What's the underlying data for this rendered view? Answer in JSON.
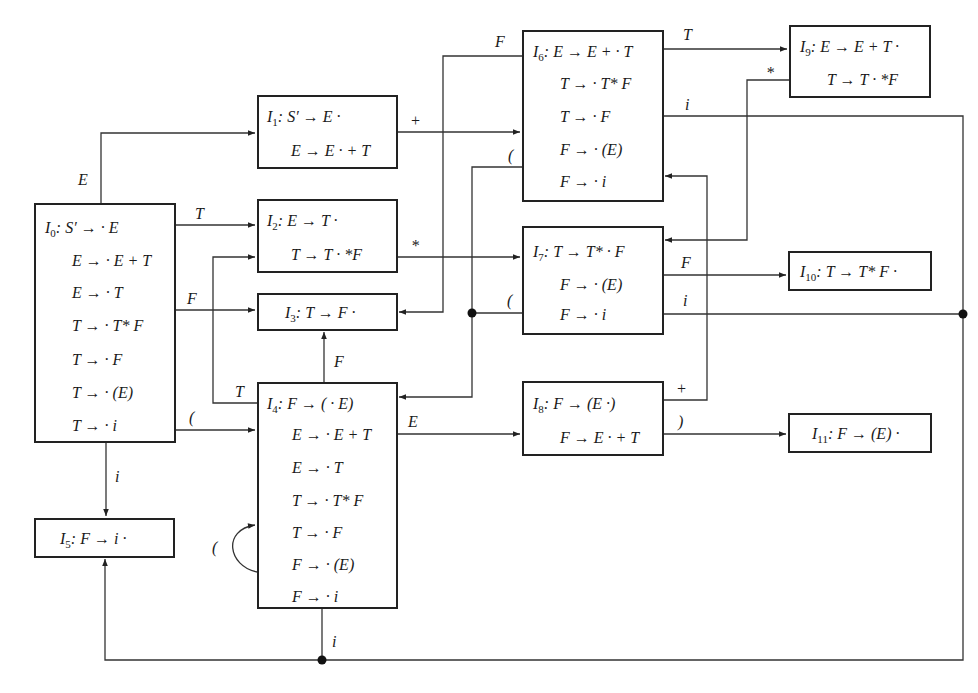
{
  "diagram": {
    "type": "LR(0) item-set automaton",
    "states": [
      {
        "id": "I0",
        "name": "I",
        "sub": "0",
        "items": [
          "S′ → · E",
          "E → · E + T",
          "E → · T",
          "T → · T* F",
          "T → · F",
          "T → · (E)",
          "T → · i"
        ]
      },
      {
        "id": "I1",
        "name": "I",
        "sub": "1",
        "items": [
          "S′ → E ·",
          "E → E · + T"
        ]
      },
      {
        "id": "I2",
        "name": "I",
        "sub": "2",
        "items": [
          "E → T ·",
          "T →  T · *F"
        ]
      },
      {
        "id": "I3",
        "name": "I",
        "sub": "3",
        "items": [
          "T → F ·"
        ]
      },
      {
        "id": "I4",
        "name": "I",
        "sub": "4",
        "items": [
          "F → ( · E)",
          "E → · E + T",
          "E → · T",
          "T → · T* F",
          "T → · F",
          "F → · (E)",
          "F → · i"
        ]
      },
      {
        "id": "I5",
        "name": "I",
        "sub": "5",
        "items": [
          "F → i ·"
        ]
      },
      {
        "id": "I6",
        "name": "I",
        "sub": "6",
        "items": [
          "E → E + · T",
          "T → · T* F",
          "T → · F",
          "F → · (E)",
          "F → · i"
        ]
      },
      {
        "id": "I7",
        "name": "I",
        "sub": "7",
        "items": [
          "T →  T* · F",
          "F → · (E)",
          "F → · i"
        ]
      },
      {
        "id": "I8",
        "name": "I",
        "sub": "8",
        "items": [
          "F → (E ·)",
          "F → E · + T"
        ]
      },
      {
        "id": "I9",
        "name": "I",
        "sub": "9",
        "items": [
          "E → E + T ·",
          "T →  T · *F"
        ]
      },
      {
        "id": "I10",
        "name": "I",
        "sub": "10",
        "items": [
          "T → T* F ·"
        ]
      },
      {
        "id": "I11",
        "name": "I",
        "sub": "11",
        "items": [
          "F → (E) ·"
        ]
      }
    ],
    "transitions": [
      {
        "from": "I0",
        "to": "I1",
        "symbol": "E"
      },
      {
        "from": "I0",
        "to": "I2",
        "symbol": "T"
      },
      {
        "from": "I0",
        "to": "I3",
        "symbol": "F"
      },
      {
        "from": "I0",
        "to": "I4",
        "symbol": "("
      },
      {
        "from": "I0",
        "to": "I5",
        "symbol": "i"
      },
      {
        "from": "I1",
        "to": "I6",
        "symbol": "+"
      },
      {
        "from": "I2",
        "to": "I7",
        "symbol": "*"
      },
      {
        "from": "I4",
        "to": "I2",
        "symbol": "T"
      },
      {
        "from": "I4",
        "to": "I3",
        "symbol": "F"
      },
      {
        "from": "I4",
        "to": "I4",
        "symbol": "("
      },
      {
        "from": "I4",
        "to": "I5",
        "symbol": "i"
      },
      {
        "from": "I4",
        "to": "I8",
        "symbol": "E"
      },
      {
        "from": "I6",
        "to": "I9",
        "symbol": "T"
      },
      {
        "from": "I6",
        "to": "I3",
        "symbol": "F"
      },
      {
        "from": "I6",
        "to": "I4",
        "symbol": "("
      },
      {
        "from": "I6",
        "to": "I5",
        "symbol": "i"
      },
      {
        "from": "I7",
        "to": "I10",
        "symbol": "F"
      },
      {
        "from": "I7",
        "to": "I4",
        "symbol": "("
      },
      {
        "from": "I7",
        "to": "I5",
        "symbol": "i"
      },
      {
        "from": "I8",
        "to": "I6",
        "symbol": "+"
      },
      {
        "from": "I8",
        "to": "I11",
        "symbol": ")"
      },
      {
        "from": "I9",
        "to": "I7",
        "symbol": "*"
      }
    ]
  },
  "edge_labels": {
    "e_I0_I1": "E",
    "t_I0_I2": "T",
    "f_I0_I3": "F",
    "lp_I0_I4": "(",
    "i_I0_I5": "i",
    "plus_I1_I6": "+",
    "star_I2_I7": "*",
    "t_I4_I2": "T",
    "f_I4_I3": "F",
    "lp_I4_I4": "(",
    "i_I4_I5": "i",
    "e_I4_I8": "E",
    "t_I6_I9": "T",
    "f_I6_I3": "F",
    "lp_I6_I4": "(",
    "i_I6_I5": "i",
    "f_I7_I10": "F",
    "lp_I7_I4": "(",
    "i_I7_I5": "i",
    "plus_I8_I6": "+",
    "rp_I8_I11": ")",
    "star_I9_I7": "*"
  },
  "colors": {
    "line": "#333333",
    "box_border": "#222222",
    "background": "#ffffff"
  }
}
